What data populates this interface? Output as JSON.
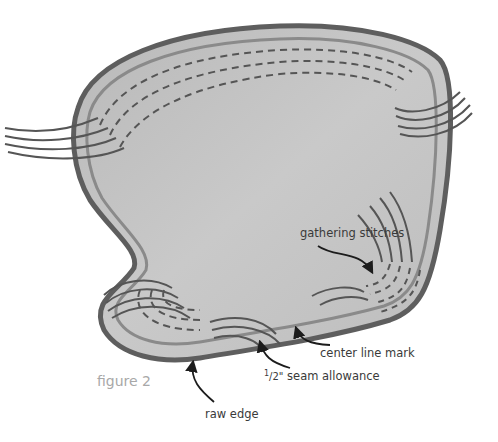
{
  "figure": {
    "caption": "figure 2"
  },
  "labels": {
    "gathering_stitches": "gathering stitches",
    "center_line_mark": "center line mark",
    "seam_allowance_prefix": "1/2\"",
    "seam_allowance_sup": "1",
    "seam_allowance_frac": "/2\"",
    "seam_allowance_text": " seam allowance",
    "raw_edge": "raw edge"
  },
  "colors": {
    "fabric_fill": "#c4c4c4",
    "outer_edge": "#5e5e5e",
    "center_line": "#8a8a8a",
    "stitches": "#555555",
    "arrow": "#1c1c1c",
    "label_text": "#3a3a3a",
    "caption_text": "#a8a8a8"
  }
}
